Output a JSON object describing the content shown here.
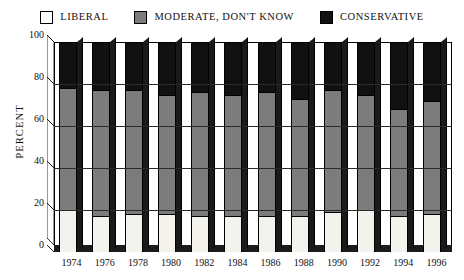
{
  "legend": {
    "items": [
      {
        "label": "LIBERAL",
        "color": "#f4f2ed",
        "icon": "legend-swatch-liberal"
      },
      {
        "label": "MODERATE, DON'T KNOW",
        "color": "#7c7c7c",
        "icon": "legend-swatch-moderate"
      },
      {
        "label": "CONSERVATIVE",
        "color": "#111111",
        "icon": "legend-swatch-conservative"
      }
    ]
  },
  "axis": {
    "ylabel": "PERCENT",
    "yticks": [
      "0",
      "20",
      "40",
      "60",
      "80",
      "100"
    ]
  },
  "chart_data": {
    "type": "bar",
    "subtype": "stacked-bar-100pct-3d",
    "title": "",
    "xlabel": "",
    "ylabel": "PERCENT",
    "ylim": [
      0,
      100
    ],
    "yticks": [
      0,
      20,
      40,
      60,
      80,
      100
    ],
    "grid": true,
    "legend_position": "top-center",
    "categories": [
      "1974",
      "1976",
      "1978",
      "1980",
      "1982",
      "1984",
      "1986",
      "1988",
      "1990",
      "1992",
      "1994",
      "1996"
    ],
    "series": [
      {
        "name": "LIBERAL",
        "color": "#f4f2ed",
        "values": [
          20,
          17,
          18,
          18,
          17,
          17,
          17,
          17,
          19,
          20,
          17,
          18
        ]
      },
      {
        "name": "MODERATE, DON'T KNOW",
        "color": "#7c7c7c",
        "values": [
          58,
          60,
          59,
          57,
          59,
          58,
          59,
          56,
          58,
          55,
          51,
          54
        ]
      },
      {
        "name": "CONSERVATIVE",
        "color": "#111111",
        "values": [
          22,
          23,
          23,
          25,
          24,
          25,
          24,
          27,
          23,
          25,
          32,
          28
        ]
      }
    ],
    "stack_tops": {
      "liberal": [
        20,
        17,
        18,
        18,
        17,
        17,
        17,
        17,
        19,
        20,
        17,
        18
      ],
      "moderate": [
        78,
        77,
        77,
        75,
        76,
        75,
        76,
        73,
        77,
        75,
        68,
        72
      ],
      "conservative": [
        100,
        100,
        100,
        100,
        100,
        100,
        100,
        100,
        100,
        100,
        100,
        100
      ]
    }
  }
}
